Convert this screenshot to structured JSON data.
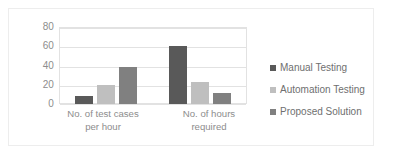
{
  "chart_data": {
    "type": "bar",
    "title": "",
    "subtitle": "",
    "xlabel": "",
    "ylabel": "",
    "categories": [
      "No. of test cases per hour",
      "No. of hours required"
    ],
    "category_lines": [
      [
        "No. of test cases",
        "per hour"
      ],
      [
        "No. of hours",
        "required"
      ]
    ],
    "series": [
      {
        "name": "Manual Testing",
        "color": "#595959",
        "values": [
          8,
          62
        ]
      },
      {
        "name": "Automation Testing",
        "color": "#bfbfbf",
        "values": [
          20,
          23
        ]
      },
      {
        "name": "Proposed Solution",
        "color": "#808080",
        "values": [
          39,
          12
        ]
      }
    ],
    "ylim": [
      0,
      80
    ],
    "yticks": [
      80,
      60,
      40,
      20,
      0
    ],
    "ytick_labels": [
      "80",
      "60",
      "40",
      "20",
      "0"
    ],
    "grid": true,
    "grid_axis": "y",
    "legend_position": "right",
    "plot_background": "#ffffff",
    "gridline_color": "#e2e2e2",
    "axis_text_color": "#8d8d8d",
    "legend_text_color": "#6f6f6f",
    "frame_color": "#ededed"
  }
}
